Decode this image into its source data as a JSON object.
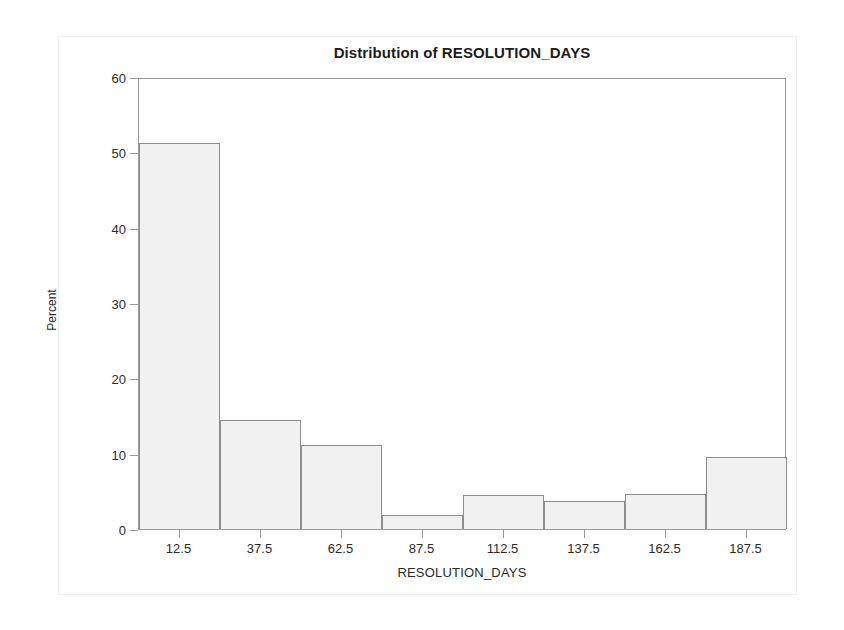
{
  "chart_data": {
    "type": "bar",
    "title": "Distribution of RESOLUTION_DAYS",
    "xlabel": "RESOLUTION_DAYS",
    "ylabel": "Percent",
    "categories": [
      "12.5",
      "37.5",
      "62.5",
      "87.5",
      "112.5",
      "137.5",
      "162.5",
      "187.5"
    ],
    "values": [
      51.3,
      14.5,
      11.2,
      1.8,
      4.5,
      3.7,
      4.6,
      9.6
    ],
    "bin_width": 25,
    "bin_edges": [
      0,
      25,
      50,
      75,
      100,
      125,
      150,
      175,
      200
    ],
    "xlim": [
      0,
      200
    ],
    "ylim": [
      0,
      60
    ],
    "ytick_labels": [
      "0",
      "10",
      "20",
      "30",
      "40",
      "50",
      "60"
    ],
    "ytick_values": [
      0,
      10,
      20,
      30,
      40,
      50,
      60
    ],
    "xtick_labels": [
      "12.5",
      "37.5",
      "62.5",
      "87.5",
      "112.5",
      "137.5",
      "162.5",
      "187.5"
    ],
    "xtick_values": [
      12.5,
      37.5,
      62.5,
      87.5,
      112.5,
      137.5,
      162.5,
      187.5
    ],
    "grid": false,
    "legend": null,
    "bar_fill_color": "#f1f1f1",
    "bar_border_color": "#8d8d8d",
    "axis_color": "#9a9a9a",
    "text_color": "#2a2a2a",
    "background_color": "#ffffff"
  }
}
